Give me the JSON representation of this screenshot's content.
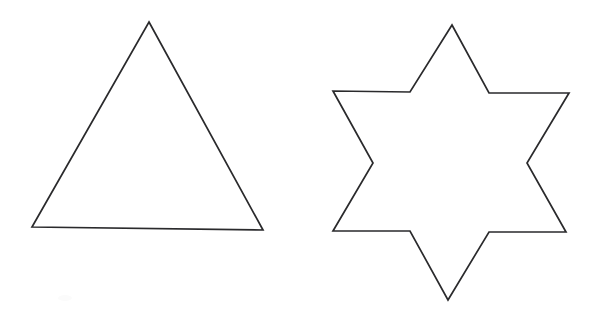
{
  "image": {
    "title": "Two outlined geometric shapes",
    "background_color": "#ffffff",
    "stroke_color": "#2a2a2c",
    "stroke_width": 1.7,
    "width": 599,
    "height": 313
  },
  "shapes": [
    {
      "id": "triangle",
      "name": "triangle",
      "label": "Triangle",
      "sides": 3,
      "fill": "#ffffff",
      "stroke": "#2a2a2c",
      "points": "149,22 263,230 32,227",
      "vertices": [
        {
          "name": "apex",
          "x": 149,
          "y": 22
        },
        {
          "name": "bottom-right",
          "x": 263,
          "y": 230
        },
        {
          "name": "bottom-left",
          "x": 32,
          "y": 227
        }
      ]
    },
    {
      "id": "six-pointed-star",
      "name": "six-pointed-star",
      "label": "Six-pointed star",
      "sides": 12,
      "points_count": 6,
      "fill": "#ffffff",
      "stroke": "#2a2a2c",
      "points": "452,25 489,93 569,93 527,163 566,232 489,232 448,300 410,231 333,231 373,163 333,91 410,92",
      "vertices": [
        {
          "name": "point-top",
          "x": 452,
          "y": 25
        },
        {
          "name": "notch-upper-right",
          "x": 489,
          "y": 93
        },
        {
          "name": "point-right-upper",
          "x": 569,
          "y": 93
        },
        {
          "name": "notch-right",
          "x": 527,
          "y": 163
        },
        {
          "name": "point-right-lower",
          "x": 566,
          "y": 232
        },
        {
          "name": "notch-lower-right",
          "x": 489,
          "y": 232
        },
        {
          "name": "point-bottom",
          "x": 448,
          "y": 300
        },
        {
          "name": "notch-lower-left",
          "x": 410,
          "y": 231
        },
        {
          "name": "point-left-lower",
          "x": 333,
          "y": 231
        },
        {
          "name": "notch-left",
          "x": 373,
          "y": 163
        },
        {
          "name": "point-left-upper",
          "x": 333,
          "y": 91
        },
        {
          "name": "notch-upper-left",
          "x": 410,
          "y": 92
        }
      ]
    }
  ],
  "artifacts": [
    {
      "id": "scan-smudge",
      "name": "scan-smudge",
      "x": 65,
      "y": 298,
      "width": 14,
      "height": 6,
      "color": "#fbfbfb"
    }
  ]
}
